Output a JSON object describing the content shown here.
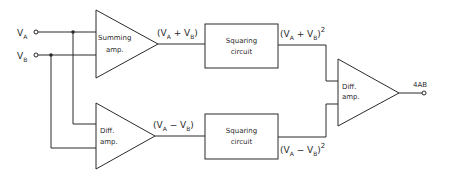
{
  "diagram": {
    "type": "block-diagram",
    "inputs": {
      "va": {
        "base": "V",
        "sub": "A"
      },
      "vb": {
        "base": "V",
        "sub": "B"
      }
    },
    "blocks": {
      "summing_amp": {
        "line1": "Summing",
        "line2": "amp."
      },
      "diff_amp_lower": {
        "line1": "Diff.",
        "line2": "amp."
      },
      "squaring_upper": {
        "line1": "Squaring",
        "line2": "circuit"
      },
      "squaring_lower": {
        "line1": "Squaring",
        "line2": "circuit"
      },
      "diff_amp_output": {
        "line1": "Diff.",
        "line2": "amp."
      }
    },
    "signals": {
      "sum": {
        "open": "(V",
        "a": "A",
        "op": " + V",
        "b": "B",
        "close": ")"
      },
      "diff": {
        "open": "(V",
        "a": "A",
        "op": " − V",
        "b": "B",
        "close": ")"
      },
      "sum_sq": {
        "open": "(V",
        "a": "A",
        "op": " + V",
        "b": "B",
        "close": ")",
        "exp": "2"
      },
      "diff_sq": {
        "open": "(V",
        "a": "A",
        "op": " − V",
        "b": "B",
        "close": ")",
        "exp": "2"
      }
    },
    "output": {
      "label": "4AB"
    }
  }
}
